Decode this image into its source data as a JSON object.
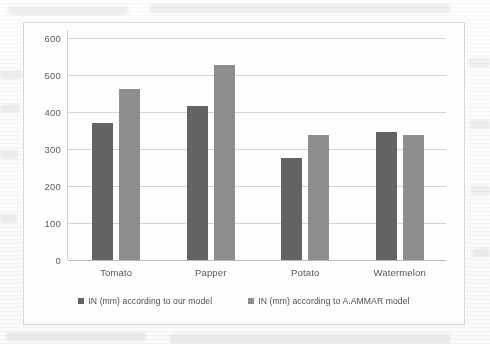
{
  "chart_data": {
    "type": "bar",
    "title": "",
    "subtitle": "",
    "xlabel": "",
    "ylabel": "",
    "categories": [
      "Tomato",
      "Papper",
      "Potato",
      "Watermelon"
    ],
    "series": [
      {
        "name": "IN (mm) according to our model",
        "color": "#636363",
        "values": [
          370,
          416,
          275,
          345
        ]
      },
      {
        "name": "IN (mm) according to A.AMMAR model",
        "color": "#8d8d8d",
        "values": [
          462,
          527,
          337,
          337
        ]
      }
    ],
    "ylim": [
      0,
      600
    ],
    "yticks": [
      0,
      100,
      200,
      300,
      400,
      500,
      600
    ],
    "ytick_labels": [
      "0",
      "100",
      "200",
      "300",
      "400",
      "500",
      "600"
    ],
    "grid": true,
    "grid_axis": "y",
    "legend_position": "bottom",
    "annotations": []
  },
  "axis": {
    "y_ticks": [
      {
        "value": 600,
        "label": "600"
      },
      {
        "value": 500,
        "label": "500"
      },
      {
        "value": 400,
        "label": "400"
      },
      {
        "value": 300,
        "label": "300"
      },
      {
        "value": 200,
        "label": "200"
      },
      {
        "value": 100,
        "label": "100"
      },
      {
        "value": 0,
        "label": "0"
      }
    ]
  },
  "legend": {
    "items": [
      {
        "label": "IN (mm) according to our model",
        "marker": "square-marker",
        "color": "#636363"
      },
      {
        "label": "IN (mm) according to A.AMMAR model",
        "marker": "square-marker",
        "color": "#8d8d8d"
      }
    ]
  },
  "colors": {
    "series_0": "#636363",
    "series_1": "#8d8d8d",
    "gridline": "#d4d4d4",
    "frame": "#d7d7d7",
    "background": "#fdfdfb",
    "tick_text": "#5c5c5c"
  }
}
